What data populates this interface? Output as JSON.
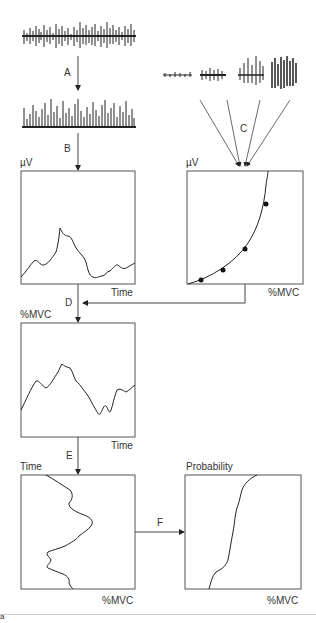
{
  "steps": {
    "a": "A",
    "b": "B",
    "c": "C",
    "d": "D",
    "e": "E",
    "f": "F"
  },
  "panels": {
    "emg_amplitude": {
      "ylabel": "µV",
      "xlabel": "Time"
    },
    "calibration": {
      "ylabel": "µV",
      "xlabel": "%MVC"
    },
    "normalized": {
      "ylabel": "%MVC",
      "xlabel": "Time"
    },
    "time_distribution": {
      "ylabel": "Time",
      "xlabel": "%MVC"
    },
    "probability": {
      "ylabel": "Probability",
      "xlabel": "%MVC"
    }
  },
  "footer": {
    "mark": "a"
  },
  "colors": {
    "line": "#333333",
    "border": "#555555",
    "separator": "#cccccc"
  }
}
